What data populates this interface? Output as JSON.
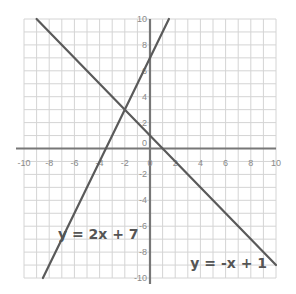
{
  "chart_data": {
    "type": "line",
    "title": "",
    "xlabel": "",
    "ylabel": "",
    "xlim": [
      -10,
      10
    ],
    "ylim": [
      -10,
      10
    ],
    "grid": true,
    "minor_grid_step": 1,
    "x_ticks": [
      -10,
      -8,
      -6,
      -4,
      -2,
      0,
      2,
      4,
      6,
      8,
      10
    ],
    "y_ticks": [
      -10,
      -8,
      -6,
      -4,
      -2,
      0,
      2,
      4,
      6,
      8,
      10
    ],
    "x_tick_labels": [
      "-10",
      "-8",
      "-6",
      "-4",
      "-2",
      "0",
      "2",
      "4",
      "6",
      "8",
      "10"
    ],
    "y_tick_labels": [
      "-10",
      "-8",
      "-6",
      "-4",
      "-2",
      "0",
      "2",
      "4",
      "6",
      "8",
      "10"
    ],
    "series": [
      {
        "name": "y = 2x + 7",
        "slope": 2,
        "intercept": 7,
        "x": [
          -8.5,
          1.5
        ],
        "y": [
          -10,
          10
        ]
      },
      {
        "name": "y = -x + 1",
        "slope": -1,
        "intercept": 1,
        "x": [
          -9,
          10
        ],
        "y": [
          10,
          -9
        ]
      }
    ],
    "annotations": [
      {
        "text": "y = 2x + 7",
        "x": -7.3,
        "y": -7
      },
      {
        "text": "y = -x + 1",
        "x": 3.2,
        "y": -9.2
      }
    ],
    "intersection": {
      "x": -2,
      "y": 3
    }
  },
  "colors": {
    "grid": "#d4d4d4",
    "axis": "#777777",
    "line": "#5a5a5a",
    "label": "#8a8a8a",
    "equation": "#555555"
  }
}
